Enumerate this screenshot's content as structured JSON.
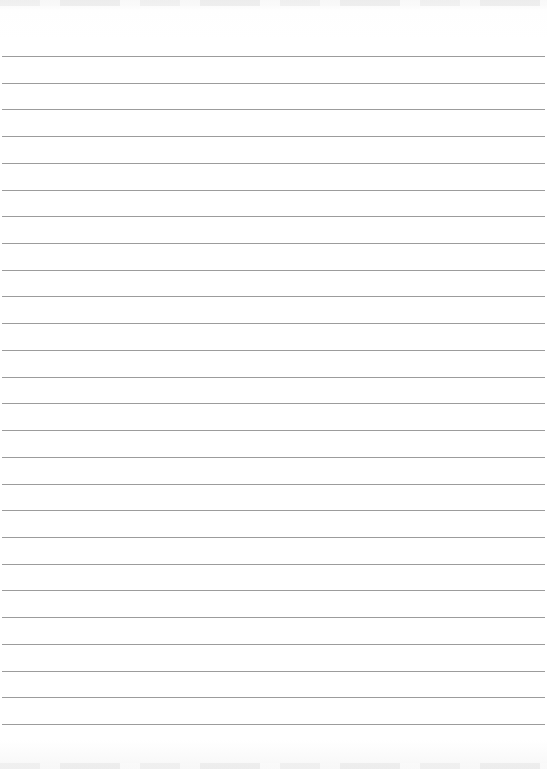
{
  "page": {
    "type": "blank ruled paper",
    "line_color": "#9c9c9c",
    "background_color": "#ffffff",
    "first_line_y": 56,
    "line_spacing": 26.72,
    "line_count": 26
  }
}
